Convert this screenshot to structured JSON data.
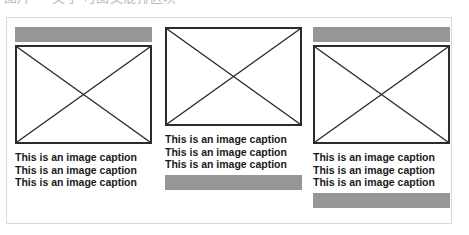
{
  "page": {
    "clipped_title": "图片 — 文字 可图文混排区块",
    "container_border_color": "#d8d8d8",
    "placeholder_bar_color": "#969696",
    "placeholder_box_border_color": "#2b2b2b",
    "caption_text_color": "#1a1a1a"
  },
  "figure": {
    "columns": [
      {
        "id": "column-1",
        "has_top_bar": true,
        "has_bottom_bar": false,
        "image_alt": "image-placeholder",
        "caption": "This is an image caption This is an image caption This is an image caption"
      },
      {
        "id": "column-2",
        "has_top_bar": false,
        "has_bottom_bar": true,
        "image_alt": "image-placeholder",
        "caption": "This is an image caption This is an image caption This is an image caption"
      },
      {
        "id": "column-3",
        "has_top_bar": true,
        "has_bottom_bar": true,
        "image_alt": "image-placeholder",
        "caption": "This is an image caption This is an image caption This is an image caption"
      }
    ]
  }
}
